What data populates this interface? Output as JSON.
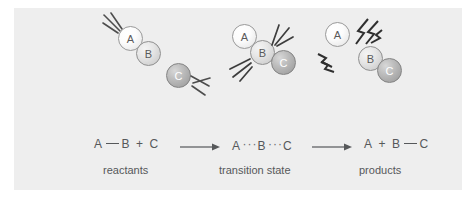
{
  "figure": {
    "background_color": "#eeeeee",
    "page_background_color": "#ffffff",
    "text_color": "#56585a"
  },
  "molecule_groups": [
    {
      "name": "reactants",
      "atoms": [
        {
          "label": "A",
          "tone": "light"
        },
        {
          "label": "B",
          "tone": "mid"
        },
        {
          "label": "C",
          "tone": "dark"
        }
      ],
      "effect": "motion-lines"
    },
    {
      "name": "transition-state",
      "atoms": [
        {
          "label": "A",
          "tone": "light"
        },
        {
          "label": "B",
          "tone": "mid"
        },
        {
          "label": "C",
          "tone": "dark"
        }
      ],
      "effect": "collision-starburst"
    },
    {
      "name": "products",
      "atoms": [
        {
          "label": "A",
          "tone": "light"
        },
        {
          "label": "B",
          "tone": "mid"
        },
        {
          "label": "C",
          "tone": "dark"
        }
      ],
      "effect": "bond-break-jagged"
    }
  ],
  "equation": {
    "reactants": {
      "left_atom": "A",
      "bond": "solid",
      "right_atom": "B",
      "plus": "+",
      "free_atom": "C"
    },
    "transition_state": {
      "left_atom": "A",
      "bond_left": "···",
      "center_atom": "B",
      "bond_right": "···",
      "right_atom": "C"
    },
    "products": {
      "free_atom": "A",
      "plus": "+",
      "left_atom": "B",
      "bond": "solid",
      "right_atom": "C"
    },
    "arrow_glyph": "→"
  },
  "captions": {
    "reactants": "reactants",
    "transition_state": "transition state",
    "products": "products"
  }
}
